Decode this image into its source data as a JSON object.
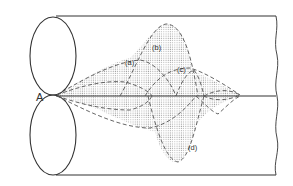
{
  "diagram": {
    "point_label": "A",
    "curve_labels": {
      "a": "(a)",
      "b": "(b)",
      "c": "(c)",
      "d": "(d)"
    },
    "colors": {
      "line": "#333333",
      "dash": "#555555",
      "stipple": "#bdbdbd"
    }
  }
}
